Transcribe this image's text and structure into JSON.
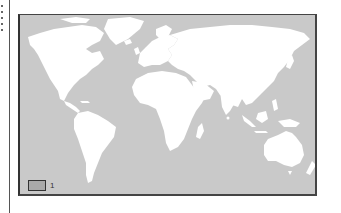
{
  "map": {
    "type": "world-map",
    "ocean_color": "#c9c9c9",
    "land_color": "#ffffff",
    "frame_color": "#333333"
  },
  "legend": {
    "items": [
      {
        "label": "1",
        "color": "#a9a9a9"
      }
    ]
  }
}
